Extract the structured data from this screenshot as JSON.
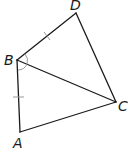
{
  "diagram": {
    "type": "quadrilateral-with-diagonal",
    "points": {
      "A": {
        "label": "A"
      },
      "B": {
        "label": "B"
      },
      "C": {
        "label": "C"
      },
      "D": {
        "label": "D"
      }
    },
    "segments": [
      "AB",
      "BD",
      "DC",
      "CA",
      "BC"
    ],
    "congruent_marks": [
      "BD",
      "AB"
    ],
    "angle_marks": [
      "DBC",
      "CBA"
    ],
    "colors": {
      "line": "#1a1a1a",
      "mark": "#999999"
    }
  }
}
